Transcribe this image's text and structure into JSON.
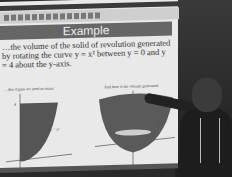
{
  "slide": {
    "title": "Example",
    "body_text": "…the volume of the solid of revolution generated by rotating the curve y = x² between y = 0 and y = 4 about the y-axis.",
    "caption_left": "…this region we need to rotate:",
    "caption_right": "And here is the volume generated:",
    "left_graph": {
      "curve_label": "y = x²",
      "y_tick": "4",
      "origin_label": "0"
    },
    "right_graph": {
      "curve_label": "y = x²",
      "shape": "paraboloid"
    }
  },
  "scene": {
    "description": "Presenter pointing at a projected math slide",
    "subject": "person with lanyard pointing at right graph"
  }
}
